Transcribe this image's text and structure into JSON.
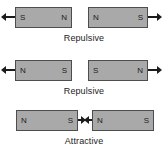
{
  "diagram": {
    "title_visible": false,
    "background_color": "#ffffff",
    "magnet_fill_color": "#a9a9a9",
    "magnet_border_color": "#4d4d4d",
    "text_color": "#1c1c1c",
    "rows": [
      {
        "caption": "Repulsive",
        "left_magnet": {
          "left_pole": "S",
          "right_pole": "N",
          "arrow_direction": "left"
        },
        "right_magnet": {
          "left_pole": "N",
          "right_pole": "S",
          "arrow_direction": "right"
        },
        "inner_arrows": false
      },
      {
        "caption": "Repulsive",
        "left_magnet": {
          "left_pole": "N",
          "right_pole": "S",
          "arrow_direction": "left"
        },
        "right_magnet": {
          "left_pole": "S",
          "right_pole": "N",
          "arrow_direction": "right"
        },
        "inner_arrows": false
      },
      {
        "caption": "Attractive",
        "left_magnet": {
          "left_pole": "N",
          "right_pole": "S",
          "arrow_direction": "right"
        },
        "right_magnet": {
          "left_pole": "N",
          "right_pole": "S",
          "arrow_direction": "left"
        },
        "inner_arrows": true
      }
    ]
  }
}
